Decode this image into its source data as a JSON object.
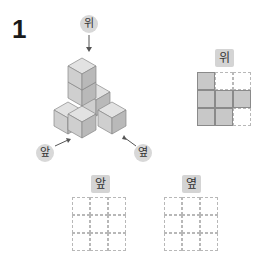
{
  "problem_number": "1",
  "figure": {
    "top_label": "위",
    "front_label": "앞",
    "side_label": "옆"
  },
  "top_view": {
    "label": "위",
    "grid": [
      [
        1,
        0,
        0
      ],
      [
        1,
        1,
        1
      ],
      [
        1,
        1,
        0
      ]
    ]
  },
  "front_view": {
    "label": "앞",
    "grid": [
      [
        0,
        0,
        0
      ],
      [
        0,
        0,
        0
      ],
      [
        0,
        0,
        0
      ]
    ]
  },
  "side_view": {
    "label": "옆",
    "grid": [
      [
        0,
        0,
        0
      ],
      [
        0,
        0,
        0
      ],
      [
        0,
        0,
        0
      ]
    ]
  }
}
